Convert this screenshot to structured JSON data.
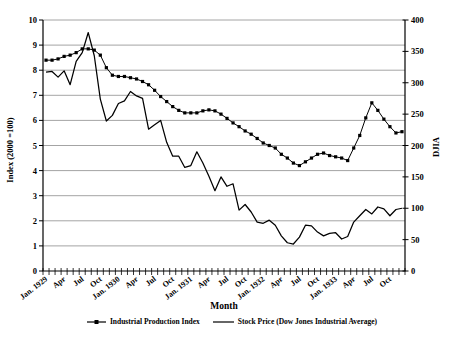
{
  "chart_data": {
    "type": "line",
    "title": "",
    "xlabel": "Month",
    "ylabel_left": "Index (2000 =100)",
    "ylabel_right": "DJIA",
    "x_tick_labels": [
      "Jan. 1929",
      "Apr",
      "Jul",
      "Oct",
      "Jan. 1930",
      "Apr",
      "Jul",
      "Oct",
      "Jan. 1931",
      "Apr",
      "Jul",
      "Oct",
      "Jan. 1932",
      "Apr",
      "Jul",
      "Oct",
      "Jan. 1933",
      "Apr",
      "Jul",
      "Oct"
    ],
    "x_label_every": 3,
    "n_points": 60,
    "ylim_left": [
      0,
      10
    ],
    "ylim_right": [
      0,
      400
    ],
    "yticks_left": [
      0,
      1,
      2,
      3,
      4,
      5,
      6,
      7,
      8,
      9,
      10
    ],
    "yticks_right": [
      0,
      50,
      100,
      150,
      200,
      250,
      300,
      350,
      400
    ],
    "grid": "horizontal",
    "colors": {
      "line": "#000000",
      "grid": "#858585",
      "background": "#ffffff"
    },
    "series": [
      {
        "name": "Industrial Production Index",
        "axis": "left",
        "marker": "square",
        "values": [
          8.4,
          8.4,
          8.45,
          8.55,
          8.6,
          8.7,
          8.85,
          8.85,
          8.8,
          8.6,
          8.1,
          7.8,
          7.75,
          7.75,
          7.7,
          7.65,
          7.55,
          7.42,
          7.2,
          6.95,
          6.75,
          6.55,
          6.4,
          6.3,
          6.3,
          6.3,
          6.38,
          6.42,
          6.38,
          6.25,
          6.08,
          5.9,
          5.75,
          5.58,
          5.45,
          5.28,
          5.1,
          5.0,
          4.9,
          4.65,
          4.5,
          4.3,
          4.2,
          4.35,
          4.5,
          4.65,
          4.7,
          4.6,
          4.55,
          4.5,
          4.4,
          4.9,
          5.4,
          6.1,
          6.7,
          6.4,
          6.05,
          5.75,
          5.5,
          5.55
        ]
      },
      {
        "name": "Stock Price (Dow Jones Industrial Average)",
        "axis": "right",
        "marker": "none",
        "values": [
          317,
          318,
          309,
          319,
          297,
          334,
          348,
          380,
          343,
          274,
          239,
          248,
          267,
          271,
          286,
          279,
          275,
          226,
          233,
          240,
          205,
          183,
          183,
          165,
          168,
          190,
          172,
          151,
          128,
          150,
          135,
          139,
          97,
          106,
          94,
          78,
          76,
          81,
          73,
          56,
          45,
          43,
          54,
          73,
          72,
          62,
          56,
          60,
          61,
          51,
          55,
          78,
          88,
          98,
          91,
          102,
          99,
          88,
          98,
          100
        ]
      }
    ]
  },
  "legend": {
    "items": [
      {
        "label": "Industrial Production Index",
        "symbol": "line-with-square-marker"
      },
      {
        "label": "Stock Price (Dow Jones Industrial Average)",
        "symbol": "solid-line"
      }
    ]
  }
}
